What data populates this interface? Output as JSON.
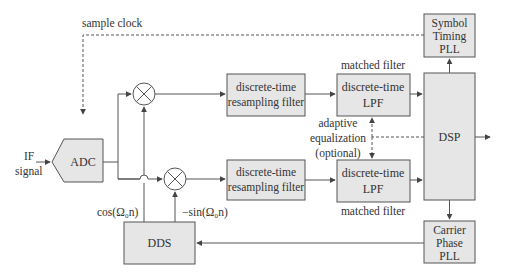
{
  "diagram": {
    "type": "block-diagram",
    "blocks": {
      "adc": "ADC",
      "resampler_top": [
        "discrete-time",
        "resampling filter"
      ],
      "resampler_bottom": [
        "discrete-time",
        "resampling filter"
      ],
      "lpf_top": [
        "discrete-time",
        "LPF"
      ],
      "lpf_bottom": [
        "discrete-time",
        "LPF"
      ],
      "dsp": "DSP",
      "symbol_timing_pll": [
        "Symbol",
        "Timing",
        "PLL"
      ],
      "carrier_phase_pll": [
        "Carrier",
        "Phase",
        "PLL"
      ],
      "dds": "DDS"
    },
    "labels": {
      "input_line1": "IF",
      "input_line2": "signal",
      "sample_clock": "sample clock",
      "matched_filter_top": "matched filter",
      "matched_filter_bottom": "matched filter",
      "adaptive_eq_line1": "adaptive",
      "adaptive_eq_line2": "equalization",
      "adaptive_eq_line3": "(optional)",
      "cos_label": "cos(Ω₀n)",
      "sin_label": "−sin(Ω₀n)"
    },
    "icons": {
      "mixer": "multiplier-circle-x"
    },
    "colors": {
      "block_fill": "#e6e6e6",
      "stroke": "#555555",
      "text": "#333333"
    }
  }
}
